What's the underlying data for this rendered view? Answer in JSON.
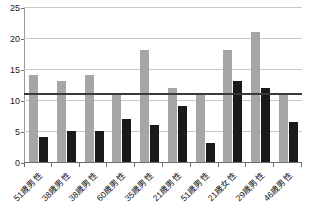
{
  "chart_data": {
    "type": "bar",
    "title": "",
    "subtitle": "",
    "xlabel": "",
    "ylabel": "",
    "ylim": [
      0,
      25
    ],
    "yticks": [
      0,
      5,
      10,
      15,
      20,
      25
    ],
    "grid": true,
    "legend": "none",
    "orientation": "vertical",
    "grouping": "grouped",
    "categories": [
      "51歳男性",
      "38歳男性",
      "38歳男性",
      "60歳男性",
      "35歳男性",
      "21歳男性",
      "51歳男性",
      "21歳女性",
      "29歳男性",
      "46歳男性"
    ],
    "series": [
      {
        "name": "gray-series",
        "color": "#a6a6a6",
        "values": [
          14,
          13,
          14,
          11,
          18,
          12,
          11,
          18,
          21,
          11
        ]
      },
      {
        "name": "black-series",
        "color": "#1a1a1a",
        "values": [
          4,
          5,
          5,
          7,
          6,
          9,
          3,
          13,
          12,
          6.5
        ]
      }
    ],
    "annotations": [
      {
        "type": "horizontal-reference-line",
        "value": 11,
        "color": "#3a3a3a"
      }
    ]
  }
}
